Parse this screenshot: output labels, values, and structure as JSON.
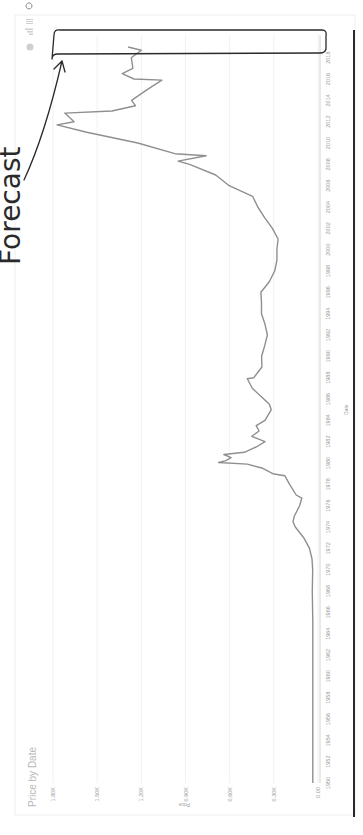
{
  "chart": {
    "title": "Price by Date",
    "x_axis_title": "Date",
    "y_axis_title": "Price",
    "toolbar_icons": [
      "circle-icon",
      "bar-chart-icon",
      "hamburger-menu-icon",
      "refresh-icon"
    ],
    "annotation": "Forecast",
    "colors": {
      "series": "#8f8f8f",
      "grid": "#f1f1f1",
      "tick_text": "#9a9a9a",
      "annotation": "#2a2a2a"
    }
  },
  "chart_data": {
    "type": "line",
    "title": "Price by Date",
    "xlabel": "Date",
    "ylabel": "Price",
    "orientation_note": "image rotated 90 degrees counterclockwise",
    "x_ticks": [
      "1950",
      "1952",
      "1954",
      "1956",
      "1958",
      "1960",
      "1962",
      "1964",
      "1966",
      "1968",
      "1970",
      "1972",
      "1974",
      "1976",
      "1978",
      "1980",
      "1982",
      "1984",
      "1986",
      "1988",
      "1990",
      "1992",
      "1994",
      "1996",
      "1998",
      "2000",
      "2002",
      "2004",
      "2006",
      "2008",
      "2010",
      "2012",
      "2014",
      "2016",
      "2018"
    ],
    "y_ticks": [
      "0.00",
      "0.30K",
      "0.60K",
      "0.90K",
      "1.20K",
      "1.50K",
      "1.80K"
    ],
    "ylim": [
      0,
      1800
    ],
    "xlim": [
      1950,
      2019
    ],
    "grid": true,
    "legend": "none",
    "series": [
      {
        "name": "Price",
        "x": [
          1950,
          1955,
          1960,
          1965,
          1968,
          1970,
          1971,
          1972,
          1973,
          1974,
          1974.5,
          1975,
          1976,
          1976.7,
          1977,
          1978,
          1978.8,
          1979,
          1979.5,
          1979.9,
          1980.05,
          1980.2,
          1980.5,
          1980.8,
          1981,
          1981.5,
          1982,
          1982.5,
          1983,
          1983.5,
          1984,
          1985,
          1985.5,
          1986,
          1987,
          1987.9,
          1988,
          1989,
          1990,
          1991,
          1992,
          1993,
          1994,
          1995,
          1996,
          1997,
          1998,
          1999,
          2000,
          2001,
          2002,
          2003,
          2004,
          2005,
          2006,
          2007,
          2008,
          2008.3,
          2008.8,
          2009,
          2010,
          2011,
          2011.7,
          2012,
          2012.8,
          2013,
          2013.5,
          2014,
          2015,
          2015.9,
          2016,
          2016.5,
          2017,
          2018,
          2018.7,
          2019
        ],
        "values": [
          35,
          35,
          35,
          35,
          39,
          36,
          41,
          58,
          97,
          154,
          170,
          161,
          125,
          110,
          148,
          193,
          225,
          307,
          375,
          480,
          675,
          630,
          590,
          640,
          500,
          420,
          360,
          450,
          400,
          420,
          360,
          317,
          330,
          368,
          446,
          480,
          437,
          381,
          383,
          362,
          344,
          360,
          384,
          384,
          388,
          331,
          294,
          279,
          279,
          271,
          310,
          363,
          409,
          444,
          603,
          695,
          872,
          950,
          760,
          972,
          1224,
          1571,
          1772,
          1657,
          1720,
          1400,
          1240,
          1266,
          1160,
          1060,
          1250,
          1330,
          1257,
          1268,
          1200,
          1290
        ]
      }
    ]
  }
}
